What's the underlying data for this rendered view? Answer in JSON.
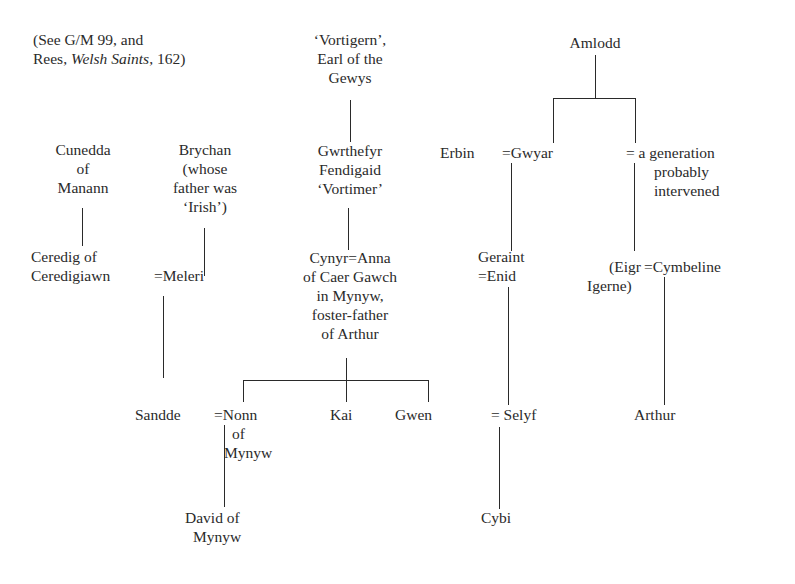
{
  "note": {
    "line1": "(See G/M 99, and",
    "line2_prefix": "Rees, ",
    "line2_italic": "Welsh Saints",
    "line2_suffix": ", 162)"
  },
  "people": {
    "vortigern": [
      "‘Vortigern’,",
      "Earl of the",
      "Gewys"
    ],
    "amlodd": [
      "Amlodd"
    ],
    "cunedda": [
      "Cunedda",
      "of",
      "Manann"
    ],
    "brychan": [
      "Brychan",
      "(whose",
      "father was",
      "‘Irish’)"
    ],
    "gwrthefyr": [
      "Gwrthefyr",
      "Fendigaid",
      "‘Vortimer’"
    ],
    "erbin": "Erbin",
    "gwyar": "=Gwyar",
    "generation_note": [
      "= a generation",
      "probably",
      "intervened"
    ],
    "ceredig": [
      "Ceredig of",
      "Ceredigiawn"
    ],
    "meleri": "=Meleri",
    "cynyr": [
      "Cynyr=Anna",
      "of Caer Gawch",
      "in Mynyw,",
      "foster-father",
      "of Arthur"
    ],
    "geraint": [
      "Geraint",
      "=Enid"
    ],
    "eigr": [
      "(Eigr",
      "Igerne)"
    ],
    "cymbeline": "=Cymbeline",
    "sandde": "Sandde",
    "nonn": [
      "=Nonn",
      "of",
      "Mynyw"
    ],
    "kai": "Kai",
    "gwen": "Gwen",
    "selyf": "= Selyf",
    "arthur": "Arthur",
    "david": [
      "David of",
      "Mynyw"
    ],
    "cybi": "Cybi"
  }
}
